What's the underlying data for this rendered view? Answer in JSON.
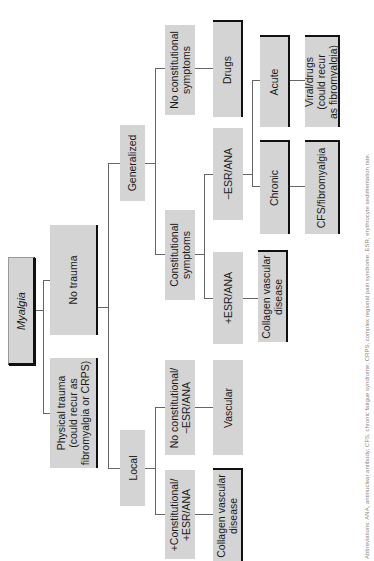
{
  "diagram": {
    "title": "Myalgia",
    "orientation": "rotated-90-ccw",
    "nodes": {
      "root": "Myalgia",
      "no_trauma": "No trauma",
      "physical_trauma": "Physical trauma\n(could recur as\nfibromyalgia or CRPS)",
      "generalized": "Generalized",
      "local": "Local",
      "no_constitutional_symptoms": "No constitutional\nsymptoms",
      "constitutional_symptoms": "Constitutional\nsymptoms",
      "local_no_constitutional": "No constitutional/\n−ESR/ANA",
      "local_plus_constitutional": "+Constitutional/\n+ESR/ANA",
      "drugs": "Drugs",
      "minus_esr_ana": "−ESR/ANA",
      "plus_esr_ana": "+ESR/ANA",
      "vascular": "Vascular",
      "local_collagen_vascular": "Collagen vascular\ndisease",
      "acute": "Acute",
      "chronic": "Chronic",
      "gen_collagen_vascular": "Collagen vascular\ndisease",
      "viral_drugs": "Viral/drugs\n(could recur\nas fibromyalgia)",
      "cfs_fibromyalgia": "CFS/fibromyalgia"
    },
    "edges": [
      [
        "root",
        "no_trauma"
      ],
      [
        "root",
        "physical_trauma"
      ],
      [
        "no_trauma",
        "generalized"
      ],
      [
        "no_trauma",
        "local"
      ],
      [
        "generalized",
        "no_constitutional_symptoms"
      ],
      [
        "generalized",
        "constitutional_symptoms"
      ],
      [
        "no_constitutional_symptoms",
        "drugs"
      ],
      [
        "constitutional_symptoms",
        "minus_esr_ana"
      ],
      [
        "constitutional_symptoms",
        "plus_esr_ana"
      ],
      [
        "minus_esr_ana",
        "acute"
      ],
      [
        "minus_esr_ana",
        "chronic"
      ],
      [
        "plus_esr_ana",
        "gen_collagen_vascular"
      ],
      [
        "acute",
        "viral_drugs"
      ],
      [
        "chronic",
        "cfs_fibromyalgia"
      ],
      [
        "local",
        "local_no_constitutional"
      ],
      [
        "local",
        "local_plus_constitutional"
      ],
      [
        "local_no_constitutional",
        "vascular"
      ],
      [
        "local_plus_constitutional",
        "local_collagen_vascular"
      ]
    ],
    "caption": "Abbreviations: ANA, antinuclear antibody; CFS, chronic fatigue syndrome; CRPS, complex regional pain syndrome; ESR, erythrocyte sedimentation rate."
  },
  "colors": {
    "box_fill": "#d4d4d4",
    "connector": "#666666",
    "shadow": "#111111"
  }
}
